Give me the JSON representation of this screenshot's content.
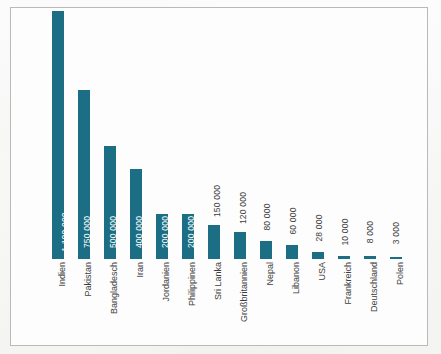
{
  "figure": {
    "frame_border_color": "#b9b9b9",
    "background_color": "#fdfdfd",
    "bar_color": "#1b6e84",
    "inside_label_color": "#ffffff",
    "outside_label_color": "#3b3b3b",
    "category_label_color": "#3d3d3d"
  },
  "chart_data": {
    "type": "bar",
    "title": "",
    "subtitle": "",
    "xlabel": "",
    "ylabel": "",
    "grid": false,
    "legend": false,
    "orientation": "vertical",
    "axis_visible": false,
    "ylim": [
      0,
      1100000
    ],
    "categories": [
      "Indien",
      "Pakistan",
      "Bangladesch",
      "Iran",
      "Jordanien",
      "Philippinen",
      "Sri Lanka",
      "Großbritannien",
      "Nepal",
      "Libanon",
      "USA",
      "Frankreich",
      "Deutschland",
      "Polen"
    ],
    "values": [
      1100000,
      750000,
      500000,
      400000,
      200000,
      200000,
      150000,
      120000,
      80000,
      60000,
      28000,
      10000,
      8000,
      3000
    ],
    "value_labels": [
      "1 100 000",
      "750 000",
      "500 000",
      "400 000",
      "200 000",
      "200 000",
      "150 000",
      "120 000",
      "80 000",
      "60 000",
      "28 000",
      "10 000",
      "8 000",
      "3 000"
    ],
    "label_placement": [
      "inside",
      "inside",
      "inside",
      "inside",
      "inside",
      "inside",
      "outside",
      "outside",
      "outside",
      "outside",
      "outside",
      "outside",
      "outside",
      "outside"
    ],
    "bars": [
      {
        "category": "Indien",
        "value": 1100000,
        "label": "1 100 000",
        "placement": "inside",
        "px_height": 248,
        "px_left": 45
      },
      {
        "category": "Pakistan",
        "value": 750000,
        "label": "750 000",
        "placement": "inside",
        "px_height": 169,
        "px_left": 71
      },
      {
        "category": "Bangladesch",
        "value": 500000,
        "label": "500 000",
        "placement": "inside",
        "px_height": 113,
        "px_left": 97
      },
      {
        "category": "Iran",
        "value": 400000,
        "label": "400 000",
        "placement": "inside",
        "px_height": 90,
        "px_left": 123
      },
      {
        "category": "Jordanien",
        "value": 200000,
        "label": "200 000",
        "placement": "inside",
        "px_height": 45,
        "px_left": 149
      },
      {
        "category": "Philippinen",
        "value": 200000,
        "label": "200 000",
        "placement": "inside",
        "px_height": 45,
        "px_left": 175
      },
      {
        "category": "Sri Lanka",
        "value": 150000,
        "label": "150 000",
        "placement": "outside",
        "px_height": 34,
        "px_left": 201
      },
      {
        "category": "Großbritannien",
        "value": 120000,
        "label": "120 000",
        "placement": "outside",
        "px_height": 27,
        "px_left": 227
      },
      {
        "category": "Nepal",
        "value": 80000,
        "label": "80 000",
        "placement": "outside",
        "px_height": 18,
        "px_left": 253
      },
      {
        "category": "Libanon",
        "value": 60000,
        "label": "60 000",
        "placement": "outside",
        "px_height": 14,
        "px_left": 279
      },
      {
        "category": "USA",
        "value": 28000,
        "label": "28 000",
        "placement": "outside",
        "px_height": 7,
        "px_left": 305
      },
      {
        "category": "Frankreich",
        "value": 10000,
        "label": "10 000",
        "placement": "outside",
        "px_height": 3,
        "px_left": 331
      },
      {
        "category": "Deutschland",
        "value": 8000,
        "label": "8 000",
        "placement": "outside",
        "px_height": 3,
        "px_left": 357
      },
      {
        "category": "Polen",
        "value": 3000,
        "label": "3 000",
        "placement": "outside",
        "px_height": 2,
        "px_left": 383
      }
    ]
  }
}
